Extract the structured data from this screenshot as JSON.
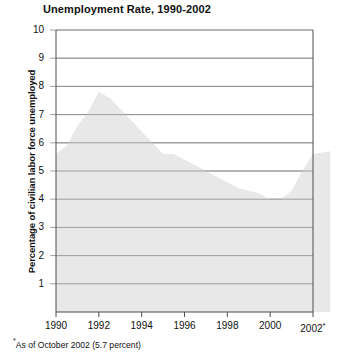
{
  "chart_data": {
    "type": "area",
    "title": "Unemployment Rate, 1990-2002",
    "xlabel": "",
    "ylabel": "Percentage of civilian labor force unemployed",
    "xlim": [
      1990,
      2002
    ],
    "ylim": [
      0,
      10
    ],
    "grid": true,
    "legend": null,
    "x_tick_labels": [
      "1990",
      "1992",
      "1994",
      "1996",
      "1998",
      "2000",
      "2002"
    ],
    "x_tick_values": [
      1990,
      1992,
      1994,
      1996,
      1998,
      2000,
      2002
    ],
    "x_last_tick_marker": "*",
    "y_tick_labels": [
      "1",
      "2",
      "3",
      "4",
      "5",
      "6",
      "7",
      "8",
      "9",
      "10"
    ],
    "y_tick_values": [
      1,
      2,
      3,
      4,
      5,
      6,
      7,
      8,
      9,
      10
    ],
    "series": [
      {
        "name": "Unemployment rate",
        "fill_color": "#e8e8e8",
        "x": [
          1990,
          1990.5,
          1991,
          1991.5,
          1992,
          1992.5,
          1993,
          1993.5,
          1994,
          1994.5,
          1995,
          1995.5,
          1996,
          1996.5,
          1997,
          1997.5,
          1998,
          1998.5,
          1999,
          1999.5,
          2000,
          2000.5,
          2001,
          2001.5,
          2002,
          2002.8
        ],
        "values": [
          5.6,
          5.9,
          6.6,
          7.1,
          7.8,
          7.6,
          7.2,
          6.8,
          6.4,
          6.0,
          5.6,
          5.6,
          5.4,
          5.2,
          5.0,
          4.8,
          4.6,
          4.4,
          4.3,
          4.2,
          4.0,
          4.0,
          4.3,
          5.0,
          5.6,
          5.7
        ]
      }
    ],
    "annotations": [
      {
        "text": "As of October 2002 (5.7 percent)",
        "marker": "*"
      }
    ]
  }
}
